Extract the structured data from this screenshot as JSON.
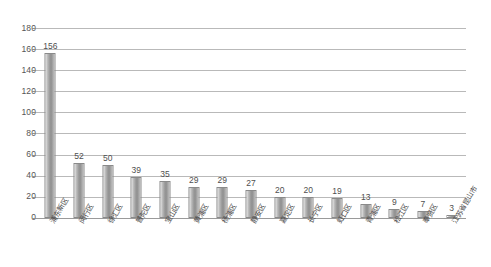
{
  "chart_data": {
    "type": "bar",
    "title": "",
    "subtitle": "",
    "xlabel": "",
    "ylabel": "",
    "ylim": [
      0,
      180
    ],
    "ytick_step": 20,
    "yticks": [
      180,
      160,
      140,
      120,
      100,
      80,
      60,
      40,
      20,
      0
    ],
    "grid": true,
    "legend": "none",
    "data_labels": true,
    "categories": [
      "浦东新区",
      "闵行区",
      "徐汇区",
      "普陀区",
      "宝山区",
      "黄浦区",
      "杨浦区",
      "静安区",
      "嘉定区",
      "长宁区",
      "虹口区",
      "青浦区",
      "松江区",
      "奉贤区",
      "江苏省昆山市"
    ],
    "values": [
      156,
      52,
      50,
      39,
      35,
      29,
      29,
      27,
      20,
      20,
      19,
      13,
      9,
      7,
      3
    ],
    "series": [
      {
        "name": "",
        "values": [
          156,
          52,
          50,
          39,
          35,
          29,
          29,
          27,
          20,
          20,
          19,
          13,
          9,
          7,
          3
        ]
      }
    ],
    "colors": {
      "bar_fill_light": "#d8d8d8",
      "bar_fill_dark": "#8f8f8f",
      "bar_border": "#8a8a8a",
      "gridline": "#b9b9b9",
      "axis": "#9a9a9a",
      "text": "#4a4a4a",
      "background": "#ffffff"
    }
  }
}
